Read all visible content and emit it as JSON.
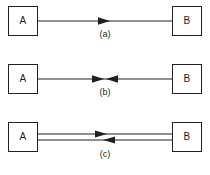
{
  "diagram": {
    "background_color": "#ffffff",
    "line_color": "#231f20",
    "box_fill_color": "#ffffff",
    "panels": [
      {
        "id": "a",
        "caption": "(a)",
        "source_label": "A",
        "target_label": "B",
        "link_type": "simplex",
        "line_count": 1,
        "arrow_directions": [
          "right"
        ]
      },
      {
        "id": "b",
        "caption": "(b)",
        "source_label": "A",
        "target_label": "B",
        "link_type": "half-duplex",
        "line_count": 1,
        "arrow_directions": [
          "right",
          "left"
        ]
      },
      {
        "id": "c",
        "caption": "(c)",
        "source_label": "A",
        "target_label": "B",
        "link_type": "full-duplex",
        "line_count": 2,
        "arrow_directions": [
          "right",
          "left"
        ]
      }
    ]
  }
}
